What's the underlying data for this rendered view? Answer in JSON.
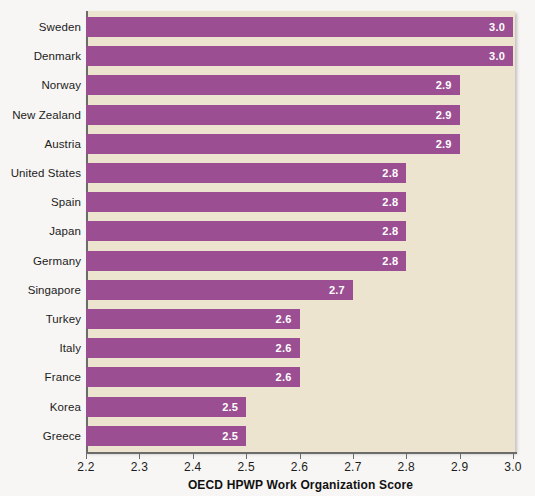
{
  "chart_data": {
    "type": "bar",
    "orientation": "horizontal",
    "title": "",
    "xlabel": "OECD HPWP Work Organization Score",
    "ylabel": "",
    "xlim": [
      2.2,
      3.0
    ],
    "xticks": [
      "2.2",
      "2.3",
      "2.4",
      "2.5",
      "2.6",
      "2.7",
      "2.8",
      "2.9",
      "3.0"
    ],
    "grid": false,
    "legend": false,
    "value_label_format": "one-decimal",
    "categories": [
      "Sweden",
      "Denmark",
      "Norway",
      "New Zealand",
      "Austria",
      "United States",
      "Spain",
      "Japan",
      "Germany",
      "Singapore",
      "Turkey",
      "Italy",
      "France",
      "Korea",
      "Greece"
    ],
    "values": [
      3.0,
      3.0,
      2.9,
      2.9,
      2.9,
      2.8,
      2.8,
      2.8,
      2.8,
      2.7,
      2.6,
      2.6,
      2.6,
      2.5,
      2.5
    ],
    "value_labels": [
      "3.0",
      "3.0",
      "2.9",
      "2.9",
      "2.9",
      "2.8",
      "2.8",
      "2.8",
      "2.8",
      "2.7",
      "2.6",
      "2.6",
      "2.6",
      "2.5",
      "2.5"
    ],
    "colors": {
      "bar": "#9b4f92",
      "plot_background": "#ece4cf",
      "page_background": "#f7f6f4",
      "axis": "#6b6b6b",
      "value_label": "#ffffff",
      "text": "#1c1c1c"
    }
  }
}
